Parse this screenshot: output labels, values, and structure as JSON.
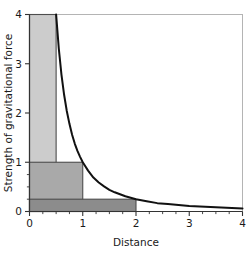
{
  "chart_data": {
    "type": "line",
    "title": "",
    "xlabel": "Distance",
    "ylabel": "Strength of gravitational force",
    "xlim": [
      0,
      4
    ],
    "ylim": [
      0,
      4
    ],
    "xticks": [
      0,
      1,
      2,
      3,
      4
    ],
    "xtick_labels": [
      "0",
      "1",
      "2",
      "3",
      "4"
    ],
    "yticks": [
      0,
      1,
      2,
      3,
      4
    ],
    "ytick_labels": [
      "0",
      "1",
      "2",
      "3",
      "4"
    ],
    "x_minor_ticks": [
      0.25,
      0.5,
      0.75,
      1.25,
      1.5,
      1.75,
      2.25,
      2.5,
      2.75,
      3.25,
      3.5,
      3.75
    ],
    "y_minor_ticks": [
      0.25,
      0.5,
      0.75
    ],
    "grid": false,
    "legend": null,
    "curve": {
      "name": "Inverse square law",
      "equation": "F = 1 / d^2",
      "color": "#111111",
      "line_width": 2,
      "x": [
        0.5,
        0.55,
        0.6,
        0.65,
        0.7,
        0.75,
        0.8,
        0.85,
        0.9,
        0.95,
        1.0,
        1.1,
        1.2,
        1.3,
        1.4,
        1.5,
        1.6,
        1.7,
        1.8,
        1.9,
        2.0,
        2.2,
        2.4,
        2.6,
        2.8,
        3.0,
        3.2,
        3.4,
        3.6,
        3.8,
        4.0
      ],
      "y": [
        4.0,
        3.31,
        2.78,
        2.37,
        2.04,
        1.78,
        1.56,
        1.38,
        1.23,
        1.11,
        1.0,
        0.83,
        0.69,
        0.59,
        0.51,
        0.44,
        0.39,
        0.35,
        0.31,
        0.28,
        0.25,
        0.21,
        0.17,
        0.15,
        0.13,
        0.11,
        0.1,
        0.09,
        0.08,
        0.07,
        0.06
      ]
    },
    "shaded_regions": [
      {
        "name": "distance-0.5-force-4",
        "distance": 0.5,
        "force": 4,
        "x0": 0,
        "x1": 0.5,
        "y0": 0,
        "y1": 4,
        "color": "#cccccc"
      },
      {
        "name": "distance-1-force-1",
        "distance": 1,
        "force": 1,
        "x0": 0,
        "x1": 1,
        "y0": 0,
        "y1": 1,
        "color": "#a9a9a9"
      },
      {
        "name": "distance-2-force-0.25",
        "distance": 2,
        "force": 0.25,
        "x0": 0,
        "x1": 2,
        "y0": 0,
        "y1": 0.25,
        "color": "#8c8c8c"
      }
    ],
    "frame_color": "#b4b4b4",
    "axis_color": "#333333"
  },
  "figure": {
    "background": "#ffffff"
  }
}
